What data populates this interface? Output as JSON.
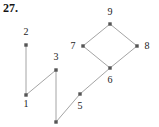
{
  "figure": {
    "problem_number": "27.",
    "caption": "",
    "width": 159,
    "height": 127,
    "background_color": "#ffffff",
    "edge_color": "#9a9a9a",
    "vertex_color": "#555555",
    "label_color": "#1c1c1c"
  },
  "graph_data": {
    "type": "diagram",
    "description": "Undirected graph with nine labeled vertices drawn as small square dots joined by thin straight line segments.",
    "vertices": [
      {
        "id": "1",
        "label": "1",
        "x": 26,
        "y": 95,
        "label_x": 26,
        "label_y": 104,
        "label_anchor": "below"
      },
      {
        "id": "2",
        "label": "2",
        "x": 26,
        "y": 45,
        "label_x": 26,
        "label_y": 32,
        "label_anchor": "above"
      },
      {
        "id": "3",
        "label": "3",
        "x": 56,
        "y": 70,
        "label_x": 56,
        "label_y": 57,
        "label_anchor": "above"
      },
      {
        "id": "4",
        "label": "",
        "x": 56,
        "y": 122,
        "label_x": 56,
        "label_y": 130,
        "label_anchor": "below"
      },
      {
        "id": "5",
        "label": "5",
        "x": 80,
        "y": 94,
        "label_x": 80,
        "label_y": 106,
        "label_anchor": "below"
      },
      {
        "id": "6",
        "label": "6",
        "x": 110,
        "y": 68,
        "label_x": 110,
        "label_y": 80,
        "label_anchor": "below"
      },
      {
        "id": "7",
        "label": "7",
        "x": 83,
        "y": 46,
        "label_x": 73,
        "label_y": 46,
        "label_anchor": "left"
      },
      {
        "id": "8",
        "label": "8",
        "x": 137,
        "y": 46,
        "label_x": 147,
        "label_y": 46,
        "label_anchor": "right"
      },
      {
        "id": "9",
        "label": "9",
        "x": 110,
        "y": 24,
        "label_x": 110,
        "label_y": 12,
        "label_anchor": "above"
      }
    ],
    "edges": [
      {
        "from": "2",
        "to": "1"
      },
      {
        "from": "1",
        "to": "3"
      },
      {
        "from": "3",
        "to": "4"
      },
      {
        "from": "4",
        "to": "5"
      },
      {
        "from": "5",
        "to": "6"
      },
      {
        "from": "6",
        "to": "7"
      },
      {
        "from": "6",
        "to": "8"
      },
      {
        "from": "7",
        "to": "9"
      },
      {
        "from": "9",
        "to": "8"
      }
    ]
  }
}
